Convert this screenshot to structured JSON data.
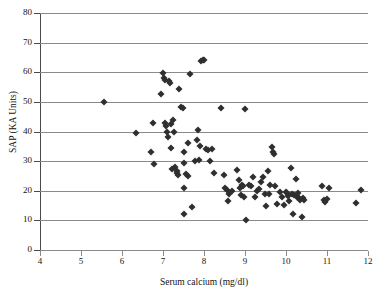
{
  "chart_data": {
    "type": "scatter",
    "title": "",
    "xlabel": "Serum calcium (mg/dl)",
    "ylabel": "SAP (KA Units)",
    "xlim": [
      4,
      12
    ],
    "ylim": [
      0,
      80
    ],
    "xticks": [
      4,
      5,
      6,
      7,
      8,
      9,
      10,
      11,
      12
    ],
    "yticks": [
      0,
      10,
      20,
      30,
      40,
      50,
      60,
      70,
      80
    ],
    "grid": "horizontal",
    "legend": "none",
    "marker": "diamond",
    "marker_color": "#2f2f2f",
    "n_points": 110,
    "points": [
      [
        5.55,
        50.0
      ],
      [
        6.35,
        39.5
      ],
      [
        6.7,
        33.1
      ],
      [
        6.75,
        43.0
      ],
      [
        6.78,
        29.0
      ],
      [
        6.95,
        52.7
      ],
      [
        7.0,
        59.8
      ],
      [
        7.02,
        58.0
      ],
      [
        7.05,
        57.3
      ],
      [
        7.05,
        43.0
      ],
      [
        7.08,
        41.8
      ],
      [
        7.1,
        39.8
      ],
      [
        7.12,
        38.0
      ],
      [
        7.15,
        57.2
      ],
      [
        7.18,
        56.3
      ],
      [
        7.2,
        34.4
      ],
      [
        7.22,
        27.4
      ],
      [
        7.25,
        44.0
      ],
      [
        7.28,
        40.0
      ],
      [
        7.3,
        28.0
      ],
      [
        7.33,
        26.0
      ],
      [
        7.36,
        25.3
      ],
      [
        7.4,
        54.4
      ],
      [
        7.45,
        48.2
      ],
      [
        7.48,
        48.0
      ],
      [
        7.5,
        33.1
      ],
      [
        7.5,
        29.5
      ],
      [
        7.5,
        20.8
      ],
      [
        7.52,
        12.0
      ],
      [
        7.55,
        25.8
      ],
      [
        7.6,
        36.0
      ],
      [
        7.62,
        25.0
      ],
      [
        7.65,
        59.3
      ],
      [
        7.7,
        14.5
      ],
      [
        7.78,
        30.2
      ],
      [
        7.82,
        37.0
      ],
      [
        7.85,
        40.5
      ],
      [
        7.88,
        30.5
      ],
      [
        7.9,
        35.0
      ],
      [
        7.92,
        63.8
      ],
      [
        7.98,
        64.2
      ],
      [
        8.0,
        64.2
      ],
      [
        8.05,
        34.0
      ],
      [
        8.1,
        33.6
      ],
      [
        8.15,
        30.0
      ],
      [
        8.2,
        34.1
      ],
      [
        8.25,
        26.0
      ],
      [
        8.42,
        47.9
      ],
      [
        8.48,
        25.2
      ],
      [
        8.52,
        20.8
      ],
      [
        8.55,
        20.3
      ],
      [
        8.58,
        16.7
      ],
      [
        8.62,
        19.0
      ],
      [
        8.8,
        27.0
      ],
      [
        8.85,
        23.5
      ],
      [
        8.88,
        20.8
      ],
      [
        8.9,
        18.5
      ],
      [
        8.92,
        22.0
      ],
      [
        8.95,
        21.5
      ],
      [
        8.98,
        18.0
      ],
      [
        9.0,
        47.5
      ],
      [
        9.02,
        10.0
      ],
      [
        9.1,
        22.0
      ],
      [
        9.15,
        21.5
      ],
      [
        9.2,
        24.6
      ],
      [
        9.25,
        18.0
      ],
      [
        9.3,
        20.0
      ],
      [
        9.4,
        23.0
      ],
      [
        9.45,
        24.5
      ],
      [
        9.48,
        19.0
      ],
      [
        9.5,
        15.0
      ],
      [
        9.55,
        26.5
      ],
      [
        9.58,
        18.8
      ],
      [
        9.6,
        22.0
      ],
      [
        9.65,
        34.8
      ],
      [
        9.68,
        33.0
      ],
      [
        9.7,
        32.5
      ],
      [
        9.72,
        21.5
      ],
      [
        9.78,
        15.5
      ],
      [
        9.85,
        19.5
      ],
      [
        9.9,
        18.0
      ],
      [
        9.95,
        15.2
      ],
      [
        10.0,
        19.5
      ],
      [
        10.02,
        19.3
      ],
      [
        10.05,
        18.2
      ],
      [
        10.08,
        16.5
      ],
      [
        10.12,
        27.8
      ],
      [
        10.15,
        19.0
      ],
      [
        10.18,
        12.3
      ],
      [
        10.2,
        18.5
      ],
      [
        10.25,
        23.8
      ],
      [
        10.28,
        18.0
      ],
      [
        10.3,
        19.2
      ],
      [
        10.32,
        17.5
      ],
      [
        10.35,
        16.8
      ],
      [
        10.38,
        11.2
      ],
      [
        10.42,
        17.5
      ],
      [
        10.88,
        21.7
      ],
      [
        10.92,
        16.8
      ],
      [
        10.95,
        16.2
      ],
      [
        11.0,
        17.2
      ],
      [
        11.05,
        20.9
      ],
      [
        11.7,
        15.9
      ],
      [
        11.82,
        20.1
      ],
      [
        7.35,
        26.8
      ],
      [
        8.68,
        20.0
      ],
      [
        9.35,
        20.5
      ],
      [
        10.45,
        17.0
      ],
      [
        7.2,
        42.5
      ]
    ]
  }
}
